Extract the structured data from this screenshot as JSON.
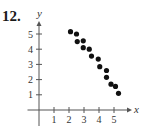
{
  "problem": {
    "number": "12."
  },
  "chart_data": {
    "type": "scatter",
    "title": "",
    "xlabel": "x",
    "ylabel": "y",
    "xlim": [
      -0.5,
      5.9
    ],
    "ylim": [
      -1.0,
      5.8
    ],
    "x_ticks": [
      1,
      2,
      3,
      4,
      5
    ],
    "y_ticks": [
      1,
      2,
      3,
      4,
      5
    ],
    "grid": false,
    "legend": null,
    "points": [
      {
        "x": 2.1,
        "y": 5.15
      },
      {
        "x": 2.5,
        "y": 5.0
      },
      {
        "x": 2.55,
        "y": 4.5
      },
      {
        "x": 2.95,
        "y": 4.55
      },
      {
        "x": 2.95,
        "y": 4.1
      },
      {
        "x": 3.35,
        "y": 4.0
      },
      {
        "x": 3.5,
        "y": 3.55
      },
      {
        "x": 3.95,
        "y": 3.35
      },
      {
        "x": 4.05,
        "y": 2.85
      },
      {
        "x": 4.5,
        "y": 2.6
      },
      {
        "x": 4.5,
        "y": 2.15
      },
      {
        "x": 4.8,
        "y": 1.7
      },
      {
        "x": 5.1,
        "y": 1.55
      },
      {
        "x": 5.3,
        "y": 1.1
      }
    ],
    "point_color": "#111111"
  }
}
